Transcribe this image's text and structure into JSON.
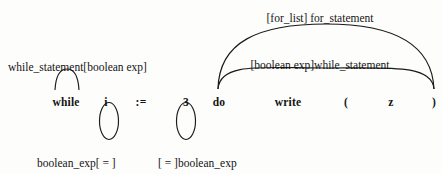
{
  "figure": {
    "kind": "parse-arc-diagram",
    "background_color": "#fdfdfc",
    "ink_color": "#1a1a1a"
  },
  "tokens": [
    {
      "id": "while",
      "text": "while",
      "x": 66,
      "y": 96
    },
    {
      "id": "i",
      "text": "i",
      "x": 106,
      "y": 96
    },
    {
      "id": "assign",
      "text": ":=",
      "x": 141,
      "y": 96
    },
    {
      "id": "three",
      "text": "3",
      "x": 186,
      "y": 96
    },
    {
      "id": "do",
      "text": "do",
      "x": 219,
      "y": 96
    },
    {
      "id": "write",
      "text": "write",
      "x": 288,
      "y": 96
    },
    {
      "id": "lparen",
      "text": "(",
      "x": 346,
      "y": 96
    },
    {
      "id": "z",
      "text": "z",
      "x": 391,
      "y": 96
    },
    {
      "id": "rparen",
      "text": ")",
      "x": 434,
      "y": 96
    }
  ],
  "labels": [
    {
      "id": "for-list-for-statement",
      "text": "[for_list] for_statement",
      "x": 320,
      "y": 12,
      "align": "center"
    },
    {
      "id": "boolean-exp-while-statement",
      "text": "[boolean exp]while_statement",
      "x": 320,
      "y": 59,
      "align": "center"
    },
    {
      "id": "while-statement-boolean-exp",
      "text": "while_statement[boolean exp]",
      "x": 8,
      "y": 61,
      "align": "left"
    },
    {
      "id": "boolean-exp-eq-left",
      "text": "boolean_exp[ = ]",
      "x": 37,
      "y": 157,
      "align": "left"
    },
    {
      "id": "eq-boolean-exp-right",
      "text": "[ = ]boolean_exp",
      "x": 158,
      "y": 157,
      "align": "left"
    }
  ],
  "arcs": [
    {
      "id": "outer-arc-for-statement",
      "from_token": "do",
      "to_token": "rparen",
      "side": "above",
      "path": "M 218 89 C 219 42 258 24 326 24 C 394 24 432 44 434 89"
    },
    {
      "id": "inner-arc-while-statement",
      "from_token": "do",
      "to_token": "rparen",
      "side": "above",
      "path": "M 218 89 C 220 62 262 68 326 68 C 390 68 432 64 434 89"
    },
    {
      "id": "small-arc-while",
      "from_token": "while",
      "to_token": "while",
      "side": "above",
      "path": "M 55 90 C 56 72 62 69 67 69 C 73 69 78 73 79 90"
    }
  ],
  "ellipses": [
    {
      "id": "ellipse-under-i",
      "cx": 109,
      "cy": 121,
      "rx": 9.5,
      "ry": 18.5
    },
    {
      "id": "ellipse-under-three",
      "cx": 186,
      "cy": 121,
      "rx": 9.5,
      "ry": 18.5
    }
  ]
}
